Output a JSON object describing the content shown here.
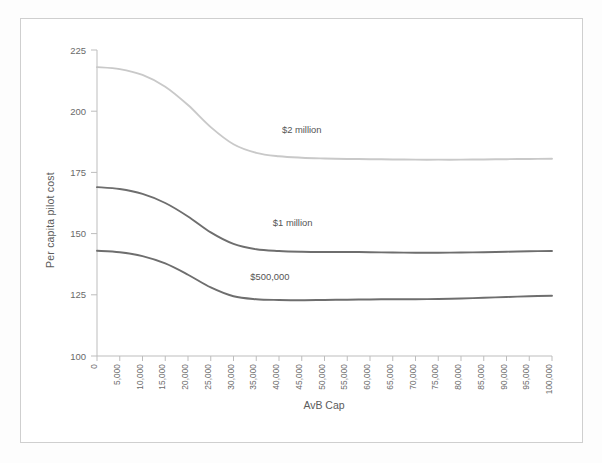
{
  "figure": {
    "background_color": "#ffffff",
    "border_color": "#cfcfcf"
  },
  "chart_data": {
    "type": "line",
    "title": "",
    "xlabel": "AvB Cap",
    "ylabel": "Per capita pilot cost",
    "xlim": [
      0,
      100000
    ],
    "ylim": [
      100,
      225
    ],
    "grid": false,
    "legend_position": "inline-annotations",
    "x": [
      0,
      5000,
      10000,
      15000,
      20000,
      25000,
      30000,
      35000,
      40000,
      45000,
      50000,
      55000,
      60000,
      65000,
      70000,
      75000,
      80000,
      85000,
      90000,
      95000,
      100000
    ],
    "xtick_labels": [
      "0",
      "5,000",
      "10,000",
      "15,000",
      "20,000",
      "25,000",
      "30,000",
      "35,000",
      "40,000",
      "45,000",
      "50,000",
      "55,000",
      "60,000",
      "65,000",
      "70,000",
      "75,000",
      "80,000",
      "85,000",
      "90,000",
      "95,000",
      "100,000"
    ],
    "ytick_labels": [
      "100",
      "125",
      "150",
      "175",
      "200",
      "225"
    ],
    "ytick_values": [
      100,
      125,
      150,
      175,
      200,
      225
    ],
    "series": [
      {
        "name": "$2 million",
        "color": "#c9c9c9",
        "label_x": 45000,
        "label_y": 191,
        "values": [
          218.0,
          217.2,
          214.8,
          210.0,
          202.5,
          193.5,
          186.5,
          183.0,
          181.6,
          181.0,
          180.7,
          180.5,
          180.4,
          180.3,
          180.2,
          180.2,
          180.2,
          180.3,
          180.4,
          180.5,
          180.6
        ]
      },
      {
        "name": "$1 million",
        "color": "#6e6e6e",
        "label_x": 43000,
        "label_y": 153,
        "values": [
          169.0,
          168.2,
          166.2,
          162.5,
          157.0,
          150.5,
          145.8,
          143.6,
          142.9,
          142.6,
          142.5,
          142.5,
          142.4,
          142.3,
          142.2,
          142.2,
          142.3,
          142.4,
          142.6,
          142.8,
          142.9
        ]
      },
      {
        "name": "$500,000",
        "color": "#6e6e6e",
        "label_x": 38000,
        "label_y": 131,
        "values": [
          143.0,
          142.4,
          140.8,
          137.8,
          133.2,
          128.0,
          124.4,
          123.2,
          122.9,
          122.8,
          122.9,
          123.0,
          123.1,
          123.2,
          123.2,
          123.3,
          123.5,
          123.8,
          124.1,
          124.4,
          124.6
        ]
      }
    ]
  }
}
